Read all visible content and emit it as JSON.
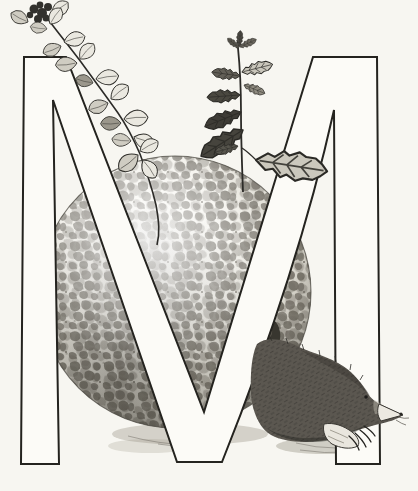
{
  "illustration": {
    "letter": "M",
    "alt": "Black-and-white pen illustration: a large outlined capital letter M with a netted melon behind it, a flowering mint sprig climbing the left diagonal stroke, a mint stem with serrated leaves rising at the top, and a mole with clawed forefoot resting at the lower right",
    "subjects": {
      "letter_m": "Capital letter M",
      "melon": "Netted melon (cantaloupe)",
      "melon_scar": "Melon blossom scar",
      "mint_vine": "Flowering mint sprig on left stroke",
      "mint_plant": "Mint stem with serrated leaves",
      "mole": "Mole",
      "shadow": "Ground shadow"
    },
    "palette": {
      "paper": "#f7f6f1",
      "ink": "#24231f",
      "letter_fill": "#fcfbf7",
      "melon_base": "#f0eee6",
      "melon_net": "#6d6960",
      "mole_fur": "#5b5750",
      "shadow": "#9b9789"
    }
  }
}
